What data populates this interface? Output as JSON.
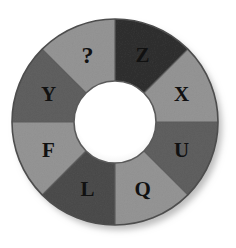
{
  "figure": {
    "name": "letter-wheel",
    "type": "segmented-ring-diagram",
    "background_color": "#ffffff",
    "hub_color": "#ffffff",
    "outline_color": "#4d4d4d",
    "label_color": "#111111",
    "shadow_color": "#cfcfcf"
  },
  "geometry": {
    "center_x": 115,
    "center_y": 122,
    "outer_radius": 103,
    "inner_radius": 41,
    "label_radius": 72,
    "segment_count": 8,
    "segment_degrees": 45,
    "first_boundary_degrees": 0
  },
  "wheel": {
    "segments": [
      {
        "label": "Z",
        "color": "#6e6e6e",
        "start_deg": 0,
        "end_deg": 45,
        "label_deg": 22.5,
        "position": "top-right"
      },
      {
        "label": "X",
        "color": "#c2c2c2",
        "start_deg": 45,
        "end_deg": 90,
        "label_deg": 67.5,
        "position": "right-upper"
      },
      {
        "label": "U",
        "color": "#9b9b9b",
        "start_deg": 90,
        "end_deg": 135,
        "label_deg": 112.5,
        "position": "right-lower"
      },
      {
        "label": "Q",
        "color": "#c2c2c2",
        "start_deg": 135,
        "end_deg": 180,
        "label_deg": 157.5,
        "position": "bottom-right"
      },
      {
        "label": "L",
        "color": "#8a8a8a",
        "start_deg": 180,
        "end_deg": 225,
        "label_deg": 202.5,
        "position": "bottom-left"
      },
      {
        "label": "F",
        "color": "#c2c2c2",
        "start_deg": 225,
        "end_deg": 270,
        "label_deg": 247.5,
        "position": "left-lower"
      },
      {
        "label": "Y",
        "color": "#9b9b9b",
        "start_deg": 270,
        "end_deg": 315,
        "label_deg": 292.5,
        "position": "left-upper"
      },
      {
        "label": "?",
        "color": "#c2c2c2",
        "start_deg": 315,
        "end_deg": 360,
        "label_deg": 337.5,
        "position": "top-left"
      }
    ]
  }
}
